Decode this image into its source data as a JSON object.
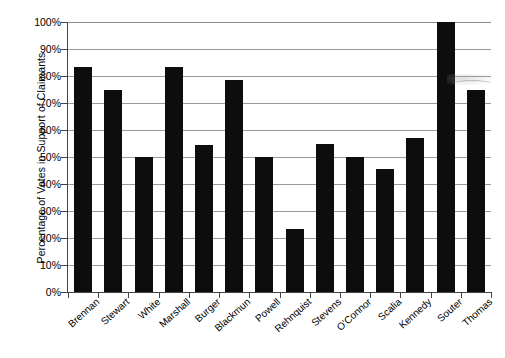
{
  "chart_data": {
    "type": "bar",
    "title": "",
    "xlabel": "",
    "ylabel": "Percentage of Votes in Support of Claimants",
    "ylim": [
      0,
      100
    ],
    "ytick_labels": [
      "0%",
      "10%",
      "20%",
      "30%",
      "40%",
      "50%",
      "60%",
      "70%",
      "80%",
      "90%",
      "100%"
    ],
    "ytick_values": [
      0,
      10,
      20,
      30,
      40,
      50,
      60,
      70,
      80,
      90,
      100
    ],
    "grid": true,
    "legend": false,
    "bar_color": "#0d0d0d",
    "categories": [
      "Brennan",
      "Stewart",
      "White",
      "Marshall",
      "Burger",
      "Blackmun",
      "Powell",
      "Rehnquist",
      "Stevens",
      "O'Connor",
      "Scalia",
      "Kennedy",
      "Souter",
      "Thomas"
    ],
    "values": [
      83.3,
      75.0,
      50.0,
      83.3,
      54.5,
      78.6,
      50.0,
      23.3,
      55.0,
      50.0,
      45.5,
      57.1,
      100.0,
      75.0
    ]
  }
}
